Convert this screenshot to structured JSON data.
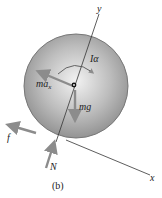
{
  "figure": {
    "caption": "(b)",
    "axes": {
      "x_label": "x",
      "y_label": "y"
    },
    "labels": {
      "inertia_moment": "Iα",
      "inertial_force": "ma",
      "inertial_force_sub": "x",
      "weight": "mg",
      "friction": "f",
      "normal": "N"
    },
    "colors": {
      "disk_light": "#e6e6e6",
      "disk_dark": "#8a8a8a",
      "arrow": "#8c8c8c",
      "line": "#333333"
    }
  }
}
